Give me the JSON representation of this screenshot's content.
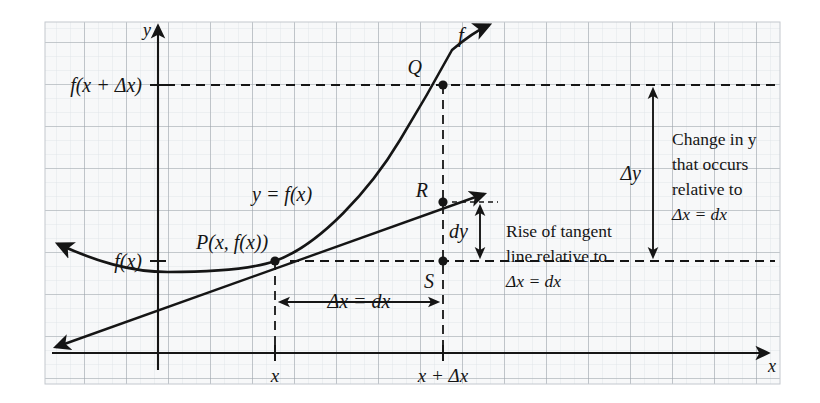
{
  "figure": {
    "type": "calculus-differential-diagram",
    "background_color": "#ffffff",
    "grid_color_minor": "#d9dde2",
    "grid_color_major": "#9aa1a8",
    "plot_fill": "#f7f8f9",
    "ink_color": "#151515"
  },
  "axes": {
    "y_axis_label": "y",
    "x_axis_label": "x",
    "y_tick_labels": [
      {
        "text": "f(x + Δx)",
        "value_y": 85
      },
      {
        "text": "f(x)",
        "value_y": 261
      }
    ],
    "x_tick_labels": [
      {
        "text": "x",
        "value_x": 275
      },
      {
        "text": "x + Δx",
        "value_x": 443
      }
    ]
  },
  "curves": {
    "function_label": "f",
    "function_equation_label": "y = f(x)",
    "tangent_line_name": "tangent-line-at-P"
  },
  "points": {
    "P": {
      "label": "P(x, f(x))",
      "x": 275,
      "y": 261
    },
    "Q": {
      "label": "Q",
      "x": 443,
      "y": 85
    },
    "R": {
      "label": "R",
      "x": 443,
      "y": 202
    },
    "S": {
      "label": "S",
      "x": 443,
      "y": 261
    }
  },
  "measures": {
    "delta_x": {
      "label": "Δx = dx",
      "from_x": 275,
      "to_x": 443,
      "at_y": 302
    },
    "dy": {
      "label": "dy",
      "from_y": 202,
      "to_y": 261,
      "at_x": 480
    },
    "delta_y": {
      "label": "Δy",
      "from_y": 85,
      "to_y": 261,
      "at_x": 653
    }
  },
  "annotations": {
    "tangent_note": {
      "lines": [
        "Rise of tangent",
        "line relative to",
        "Δx = dx"
      ]
    },
    "change_note": {
      "lines": [
        "Change in y",
        "that occurs",
        "relative to",
        "Δx = dx"
      ]
    }
  }
}
